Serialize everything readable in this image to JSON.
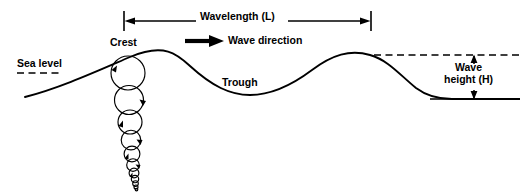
{
  "diagram": {
    "background_color": "#ffffff",
    "stroke_color": "#000000",
    "labels": {
      "wavelength": "Wavelength (L)",
      "wave_direction": "Wave direction",
      "crest": "Crest",
      "sea_level": "Sea level",
      "trough": "Trough",
      "wave_height_line1": "Wave",
      "wave_height_line2": "height (H)"
    },
    "measures": {
      "wavelength_start_x": 124,
      "wavelength_end_x": 371,
      "wavelength_y": 21,
      "sea_level_y": 73,
      "crest_level_y": 55,
      "trough_level_y": 99,
      "wave_height_top_y": 55,
      "wave_height_bottom_y": 99
    },
    "wave_profile": {
      "crest_x": [
        130,
        370
      ],
      "trough_x": [
        250
      ],
      "left_start": [
        25,
        97
      ],
      "right_end": [
        520,
        99
      ]
    },
    "orbital_circles": {
      "description": "Circular water particle orbits decreasing in diameter with depth",
      "center_x": 128,
      "count": 11,
      "top_radius": 17,
      "bottom_y": 190
    }
  }
}
